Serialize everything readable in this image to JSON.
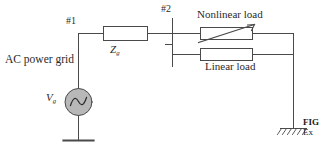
{
  "figure": {
    "type": "circuit-schematic",
    "background_color": "#ffffff",
    "line_color": "#4a4a4a",
    "text_color": "#2a2a2a",
    "source_fill_color": "#b8b8b8"
  },
  "labels": {
    "ac_power_grid": "AC power grid",
    "node_1": "#1",
    "node_2": "#2",
    "source_voltage": "V",
    "source_voltage_subscript": "g",
    "grid_impedance": "Z",
    "grid_impedance_subscript": "g",
    "nonlinear_load": "Nonlinear load",
    "linear_load": "Linear load"
  },
  "caption": {
    "figure_number": "FIG",
    "line_1": "Ex"
  },
  "components": [
    {
      "name": "ac-voltage-source",
      "symbol": "circle-with-sine-wave",
      "label": "Vg"
    },
    {
      "name": "grid-impedance",
      "symbol": "rectangle-impedance-box",
      "label": "Zg"
    },
    {
      "name": "nonlinear-load",
      "symbol": "rectangle-with-diagonal-arrow",
      "label": "Nonlinear load"
    },
    {
      "name": "linear-load",
      "symbol": "rectangle-resistor-box",
      "label": "Linear load"
    },
    {
      "name": "source-ground",
      "symbol": "ground-bar"
    },
    {
      "name": "load-ground",
      "symbol": "hatched-earth-ground"
    }
  ]
}
